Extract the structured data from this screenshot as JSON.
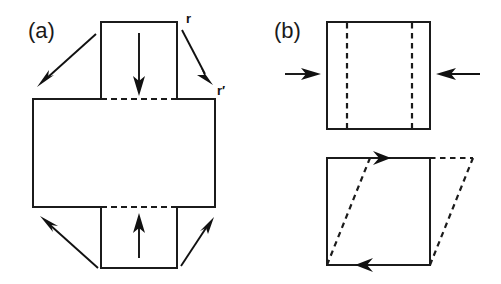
{
  "figure": {
    "background_color": "#ffffff",
    "stroke_color": "#1b1b1b",
    "width": 501,
    "height": 284,
    "panels": [
      {
        "id": "panel-a",
        "label": "(a)",
        "label_x": 28,
        "label_y": 38,
        "description": "Unfolded cross-shaped net of a box with inward-pointing arrows on the four flaps and diagonal arrows at the corners mapping r to r-prime",
        "vector_labels": [
          {
            "name": "r",
            "text": "r",
            "x": 186,
            "y": 23
          },
          {
            "name": "r-prime",
            "text": "r′",
            "x": 218,
            "y": 94
          }
        ],
        "horizontal_face": {
          "x": 33,
          "y": 99,
          "width": 182,
          "height": 108
        },
        "vertical_face": {
          "x": 101,
          "y": 22,
          "width": 76,
          "height": 246
        },
        "fold_lines": [
          {
            "name": "upper-fold",
            "x1": 101,
            "y1": 99,
            "x2": 177,
            "y2": 99
          },
          {
            "name": "lower-fold",
            "x1": 101,
            "y1": 207,
            "x2": 177,
            "y2": 207
          }
        ],
        "straight_arrows": [
          {
            "name": "top-flap-arrow",
            "x1": 139,
            "y1": 33,
            "x2": 139,
            "y2": 96,
            "direction": "down"
          },
          {
            "name": "bottom-flap-arrow",
            "x1": 139,
            "y1": 258,
            "x2": 139,
            "y2": 213,
            "direction": "up"
          }
        ],
        "diagonal_arrows": [
          {
            "name": "top-left-diagonal-arrow",
            "x1": 96,
            "y1": 34,
            "x2": 38,
            "y2": 86
          },
          {
            "name": "top-right-diagonal-arrow",
            "x1": 182,
            "y1": 30,
            "x2": 213,
            "y2": 84
          },
          {
            "name": "bottom-left-diagonal-arrow",
            "x1": 98,
            "y1": 268,
            "x2": 41,
            "y2": 216
          },
          {
            "name": "bottom-right-diagonal-arrow",
            "x1": 181,
            "y1": 266,
            "x2": 214,
            "y2": 217
          }
        ]
      },
      {
        "id": "panel-b",
        "label": "(b)",
        "label_x": 274,
        "label_y": 38,
        "description": "Top: square face compressed by two opposing horizontal arrows with two vertical dashed lines inside. Bottom: square sheared into a dashed parallelogram with circulation arrows on the top and bottom edges",
        "top_square": {
          "x": 327,
          "y": 22,
          "width": 103,
          "height": 107
        },
        "top_dashed_lines": [
          {
            "name": "left-dashed-line",
            "x": 347,
            "y1": 22,
            "y2": 129
          },
          {
            "name": "right-dashed-line",
            "x": 412,
            "y1": 22,
            "y2": 129
          }
        ],
        "compression_arrows": [
          {
            "name": "left-compression-arrow",
            "x1": 285,
            "y1": 74,
            "x2": 321,
            "y2": 74,
            "direction": "right"
          },
          {
            "name": "right-compression-arrow",
            "x1": 480,
            "y1": 74,
            "x2": 436,
            "y2": 74,
            "direction": "left"
          }
        ],
        "bottom_square": {
          "x": 327,
          "y": 158,
          "width": 103,
          "height": 107
        },
        "shear_offset": 43,
        "shear_dashed_edges": [
          {
            "name": "shear-left-edge",
            "x1": 327,
            "y1": 265,
            "x2": 370,
            "y2": 158
          },
          {
            "name": "shear-right-edge",
            "x1": 430,
            "y1": 265,
            "x2": 473,
            "y2": 158
          },
          {
            "name": "shear-top-edge",
            "x1": 430,
            "y1": 158,
            "x2": 473,
            "y2": 158
          }
        ],
        "circulation_arrows": [
          {
            "name": "top-edge-circulation-arrow",
            "x": 389,
            "y": 158,
            "direction": "right"
          },
          {
            "name": "bottom-edge-circulation-arrow",
            "x": 368,
            "y": 265,
            "direction": "left"
          }
        ]
      }
    ]
  }
}
